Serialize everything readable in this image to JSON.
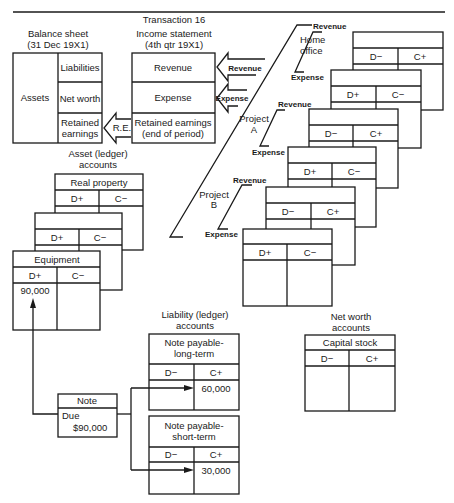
{
  "title": "Transaction 16",
  "balance_sheet": {
    "heading_line1": "Balance sheet",
    "heading_line2": "(31 Dec 19X1)",
    "assets": "Assets",
    "liabilities": "Liabilities",
    "net_worth": "Net worth",
    "retained_line1": "Retained",
    "retained_line2": "earnings"
  },
  "income_statement": {
    "heading_line1": "Income statement",
    "heading_line2": "(4th qtr 19X1)",
    "revenue": "Revenue",
    "expense": "Expense",
    "retained_line1": "Retained earnings",
    "retained_line2": "(end of period)"
  },
  "flows": {
    "revenue_arrow": "Revenue",
    "expense_arrow": "Expense",
    "re_arrow": "R.E."
  },
  "divisions": [
    {
      "name_line1": "Home",
      "name_line2": "office",
      "revenue": "Revenue",
      "expense": "Expense"
    },
    {
      "name_line1": "Project",
      "name_line2": "A",
      "revenue": "Revenue",
      "expense": "Expense"
    },
    {
      "name_line1": "Project",
      "name_line2": "B",
      "revenue": "Revenue",
      "expense": "Expense"
    }
  ],
  "division_ledgers": [
    {
      "debit": "D−",
      "credit": "C+"
    },
    {
      "debit": "D+",
      "credit": "C−"
    },
    {
      "debit": "D−",
      "credit": "C+"
    },
    {
      "debit": "D+",
      "credit": "C−"
    },
    {
      "debit": "D−",
      "credit": "C+"
    },
    {
      "debit": "D+",
      "credit": "C−"
    }
  ],
  "asset_accounts": {
    "heading_line1": "Asset (ledger)",
    "heading_line2": "accounts",
    "cards": [
      {
        "title": "Real property",
        "debit": "D+",
        "credit": "C−",
        "debit_value": ""
      },
      {
        "title": "",
        "debit": "D+",
        "credit": "C−",
        "debit_value": ""
      },
      {
        "title": "Equipment",
        "debit": "D+",
        "credit": "C−",
        "debit_value": "90,000"
      }
    ]
  },
  "liability_accounts": {
    "heading_line1": "Liability (ledger)",
    "heading_line2": "accounts",
    "cards": [
      {
        "title_line1": "Note payable-",
        "title_line2": "long-term",
        "debit": "D−",
        "credit": "C+",
        "credit_value": "60,000"
      },
      {
        "title_line1": "Note payable-",
        "title_line2": "short-term",
        "debit": "D−",
        "credit": "C+",
        "credit_value": "30,000"
      }
    ]
  },
  "net_worth_accounts": {
    "heading_line1": "Net worth",
    "heading_line2": "accounts",
    "cards": [
      {
        "title": "Capital stock",
        "debit": "D−",
        "credit": "C+"
      }
    ]
  },
  "note": {
    "title": "Note",
    "due_label": "Due",
    "amount": "$90,000"
  }
}
